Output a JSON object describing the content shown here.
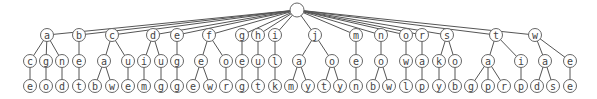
{
  "diagram": {
    "type": "tree",
    "root": {
      "id": "root",
      "label": "",
      "x": 297,
      "y": 10
    },
    "nodes": [
      {
        "id": "a",
        "label": "a",
        "x": 47,
        "y": 35,
        "parent": "root"
      },
      {
        "id": "b",
        "label": "b",
        "x": 79,
        "y": 35,
        "parent": "root"
      },
      {
        "id": "c",
        "label": "c",
        "x": 112,
        "y": 35,
        "parent": "root"
      },
      {
        "id": "d",
        "label": "d",
        "x": 153,
        "y": 35,
        "parent": "root"
      },
      {
        "id": "e1",
        "label": "e",
        "x": 177,
        "y": 35,
        "parent": "root"
      },
      {
        "id": "f",
        "label": "f",
        "x": 209,
        "y": 35,
        "parent": "root"
      },
      {
        "id": "g",
        "label": "g",
        "x": 242,
        "y": 35,
        "parent": "root"
      },
      {
        "id": "h",
        "label": "h",
        "x": 258,
        "y": 35,
        "parent": "root"
      },
      {
        "id": "i",
        "label": "i",
        "x": 275,
        "y": 35,
        "parent": "root"
      },
      {
        "id": "j",
        "label": "j",
        "x": 315,
        "y": 35,
        "parent": "root"
      },
      {
        "id": "m",
        "label": "m",
        "x": 356,
        "y": 35,
        "parent": "root"
      },
      {
        "id": "n",
        "label": "n",
        "x": 381,
        "y": 35,
        "parent": "root"
      },
      {
        "id": "o1",
        "label": "o",
        "x": 406,
        "y": 35,
        "parent": "root"
      },
      {
        "id": "r",
        "label": "r",
        "x": 422,
        "y": 35,
        "parent": "root"
      },
      {
        "id": "s",
        "label": "s",
        "x": 447,
        "y": 35,
        "parent": "root"
      },
      {
        "id": "t",
        "label": "t",
        "x": 496,
        "y": 35,
        "parent": "root"
      },
      {
        "id": "w",
        "label": "w",
        "x": 535,
        "y": 35,
        "parent": "root"
      },
      {
        "id": "a_c",
        "label": "c",
        "x": 30,
        "y": 61,
        "parent": "a"
      },
      {
        "id": "a_g",
        "label": "g",
        "x": 46,
        "y": 61,
        "parent": "a"
      },
      {
        "id": "a_n",
        "label": "n",
        "x": 62,
        "y": 61,
        "parent": "a"
      },
      {
        "id": "b_e",
        "label": "e",
        "x": 79,
        "y": 61,
        "parent": "b"
      },
      {
        "id": "c_a",
        "label": "a",
        "x": 104,
        "y": 61,
        "parent": "c"
      },
      {
        "id": "c_u",
        "label": "u",
        "x": 128,
        "y": 61,
        "parent": "c"
      },
      {
        "id": "d_i",
        "label": "i",
        "x": 144,
        "y": 61,
        "parent": "d"
      },
      {
        "id": "d_u",
        "label": "u",
        "x": 161,
        "y": 61,
        "parent": "d"
      },
      {
        "id": "e1_g",
        "label": "g",
        "x": 177,
        "y": 61,
        "parent": "e1"
      },
      {
        "id": "f_e",
        "label": "e",
        "x": 201,
        "y": 61,
        "parent": "f"
      },
      {
        "id": "f_o",
        "label": "o",
        "x": 226,
        "y": 61,
        "parent": "f"
      },
      {
        "id": "g_e",
        "label": "e",
        "x": 242,
        "y": 61,
        "parent": "g"
      },
      {
        "id": "h_u",
        "label": "u",
        "x": 258,
        "y": 61,
        "parent": "h"
      },
      {
        "id": "i_l",
        "label": "l",
        "x": 275,
        "y": 61,
        "parent": "i"
      },
      {
        "id": "j_a",
        "label": "a",
        "x": 299,
        "y": 61,
        "parent": "j"
      },
      {
        "id": "j_o",
        "label": "o",
        "x": 332,
        "y": 61,
        "parent": "j"
      },
      {
        "id": "m_e",
        "label": "e",
        "x": 356,
        "y": 61,
        "parent": "m"
      },
      {
        "id": "n_o",
        "label": "o",
        "x": 381,
        "y": 61,
        "parent": "n"
      },
      {
        "id": "o1_w",
        "label": "w",
        "x": 406,
        "y": 61,
        "parent": "o1"
      },
      {
        "id": "r_a",
        "label": "a",
        "x": 422,
        "y": 61,
        "parent": "r"
      },
      {
        "id": "s_k",
        "label": "k",
        "x": 439,
        "y": 61,
        "parent": "s"
      },
      {
        "id": "s_o",
        "label": "o",
        "x": 455,
        "y": 61,
        "parent": "s"
      },
      {
        "id": "t_a",
        "label": "a",
        "x": 488,
        "y": 61,
        "parent": "t"
      },
      {
        "id": "t_i",
        "label": "i",
        "x": 521,
        "y": 61,
        "parent": "t"
      },
      {
        "id": "w_a",
        "label": "a",
        "x": 545,
        "y": 61,
        "parent": "w"
      },
      {
        "id": "w_e",
        "label": "e",
        "x": 570,
        "y": 61,
        "parent": "w"
      },
      {
        "id": "a_c_e",
        "label": "e",
        "x": 30,
        "y": 86,
        "parent": "a_c"
      },
      {
        "id": "a_g_o",
        "label": "o",
        "x": 46,
        "y": 86,
        "parent": "a_g"
      },
      {
        "id": "a_n_d",
        "label": "d",
        "x": 62,
        "y": 86,
        "parent": "a_n"
      },
      {
        "id": "b_e_t",
        "label": "t",
        "x": 79,
        "y": 86,
        "parent": "b_e"
      },
      {
        "id": "c_a_b",
        "label": "b",
        "x": 95,
        "y": 86,
        "parent": "c_a"
      },
      {
        "id": "c_a_w",
        "label": "w",
        "x": 112,
        "y": 86,
        "parent": "c_a"
      },
      {
        "id": "c_u_e",
        "label": "e",
        "x": 128,
        "y": 86,
        "parent": "c_u"
      },
      {
        "id": "d_i_m",
        "label": "m",
        "x": 144,
        "y": 86,
        "parent": "d_i"
      },
      {
        "id": "d_u_g",
        "label": "g",
        "x": 161,
        "y": 86,
        "parent": "d_u"
      },
      {
        "id": "e1_g_g",
        "label": "g",
        "x": 177,
        "y": 86,
        "parent": "e1_g"
      },
      {
        "id": "f_e_e",
        "label": "e",
        "x": 193,
        "y": 86,
        "parent": "f_e"
      },
      {
        "id": "f_e_w",
        "label": "w",
        "x": 210,
        "y": 86,
        "parent": "f_e"
      },
      {
        "id": "f_o_r",
        "label": "r",
        "x": 226,
        "y": 86,
        "parent": "f_o"
      },
      {
        "id": "g_e_g",
        "label": "g",
        "x": 242,
        "y": 86,
        "parent": "g_e"
      },
      {
        "id": "h_u_t",
        "label": "t",
        "x": 258,
        "y": 86,
        "parent": "h_u"
      },
      {
        "id": "i_l_k",
        "label": "k",
        "x": 275,
        "y": 86,
        "parent": "i_l"
      },
      {
        "id": "j_a_m",
        "label": "m",
        "x": 291,
        "y": 86,
        "parent": "j_a"
      },
      {
        "id": "j_a_y",
        "label": "y",
        "x": 308,
        "y": 86,
        "parent": "j_a"
      },
      {
        "id": "j_o_t",
        "label": "t",
        "x": 324,
        "y": 86,
        "parent": "j_o"
      },
      {
        "id": "j_o_y",
        "label": "y",
        "x": 340,
        "y": 86,
        "parent": "j_o"
      },
      {
        "id": "m_e_n",
        "label": "n",
        "x": 356,
        "y": 86,
        "parent": "m_e"
      },
      {
        "id": "n_o_b",
        "label": "b",
        "x": 373,
        "y": 86,
        "parent": "n_o"
      },
      {
        "id": "n_o_w",
        "label": "w",
        "x": 389,
        "y": 86,
        "parent": "n_o"
      },
      {
        "id": "o1_w_l",
        "label": "l",
        "x": 406,
        "y": 86,
        "parent": "o1_w"
      },
      {
        "id": "r_a_p",
        "label": "p",
        "x": 422,
        "y": 86,
        "parent": "r_a"
      },
      {
        "id": "s_k_y",
        "label": "y",
        "x": 439,
        "y": 86,
        "parent": "s_k"
      },
      {
        "id": "s_o_b",
        "label": "b",
        "x": 455,
        "y": 86,
        "parent": "s_o"
      },
      {
        "id": "t_a_g",
        "label": "g",
        "x": 471,
        "y": 86,
        "parent": "t_a"
      },
      {
        "id": "t_a_p",
        "label": "p",
        "x": 488,
        "y": 86,
        "parent": "t_a"
      },
      {
        "id": "t_a_r",
        "label": "r",
        "x": 504,
        "y": 86,
        "parent": "t_a"
      },
      {
        "id": "t_i_p",
        "label": "p",
        "x": 521,
        "y": 86,
        "parent": "t_i"
      },
      {
        "id": "w_a_d",
        "label": "d",
        "x": 537,
        "y": 86,
        "parent": "w_a"
      },
      {
        "id": "w_a_s",
        "label": "s",
        "x": 553,
        "y": 86,
        "parent": "w_a"
      },
      {
        "id": "w_e_e",
        "label": "e",
        "x": 570,
        "y": 86,
        "parent": "w_e"
      }
    ],
    "style": {
      "root_radius": 7,
      "node_radius": 6.5,
      "stroke": "#666666",
      "text_color": "#444444"
    }
  }
}
